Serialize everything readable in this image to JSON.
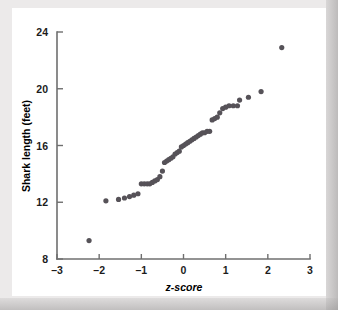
{
  "chart_data": {
    "type": "scatter",
    "title": "",
    "xlabel": "z-score",
    "ylabel": "Shark length (feet)",
    "xlim": [
      -3,
      3
    ],
    "ylim": [
      8,
      24
    ],
    "xticks": [
      -3,
      -2,
      -1,
      0,
      1,
      2,
      3
    ],
    "xticklabels": [
      "–3",
      "–2",
      "–1",
      "0",
      "1",
      "2",
      "3"
    ],
    "yticks": [
      8,
      12,
      16,
      20,
      24
    ],
    "yticklabels": [
      "8",
      "12",
      "16",
      "20",
      "24"
    ],
    "grid": false,
    "legend": null,
    "point_color": "#565258",
    "point_radius": 2.6,
    "series": [
      {
        "name": "Shark length normal quantile plot",
        "x": [
          -2.24,
          -1.84,
          -1.54,
          -1.4,
          -1.28,
          -1.18,
          -1.08,
          -1.0,
          -0.93,
          -0.86,
          -0.8,
          -0.74,
          -0.68,
          -0.62,
          -0.56,
          -0.5,
          -0.45,
          -0.4,
          -0.35,
          -0.3,
          -0.25,
          -0.2,
          -0.15,
          -0.1,
          -0.05,
          0.0,
          0.05,
          0.1,
          0.15,
          0.2,
          0.25,
          0.3,
          0.35,
          0.4,
          0.45,
          0.5,
          0.56,
          0.62,
          0.68,
          0.74,
          0.8,
          0.86,
          0.93,
          1.0,
          1.08,
          1.18,
          1.28,
          1.33,
          1.54,
          1.84,
          2.33
        ],
        "y": [
          9.3,
          12.1,
          12.2,
          12.3,
          12.4,
          12.5,
          12.6,
          13.3,
          13.3,
          13.3,
          13.3,
          13.4,
          13.5,
          13.6,
          13.8,
          14.2,
          14.8,
          14.9,
          15.0,
          15.1,
          15.2,
          15.4,
          15.5,
          15.6,
          15.9,
          16.0,
          16.1,
          16.2,
          16.3,
          16.4,
          16.5,
          16.6,
          16.7,
          16.8,
          16.9,
          16.9,
          17.0,
          17.0,
          17.8,
          17.9,
          18.0,
          18.3,
          18.6,
          18.7,
          18.8,
          18.8,
          18.8,
          19.2,
          19.4,
          19.8,
          22.9
        ]
      }
    ]
  },
  "figure": {
    "background_color": "#eceaea",
    "plot_background_color": "#ffffff",
    "axis_color": "#6f6f6f"
  }
}
